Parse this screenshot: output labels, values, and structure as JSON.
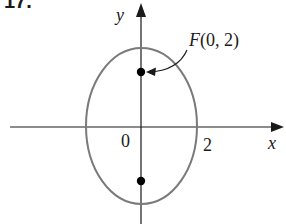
{
  "figure": {
    "problem_number": "17.",
    "axis_labels": {
      "x": "x",
      "y": "y"
    },
    "tick_labels": {
      "origin": "0",
      "x_tick": "2"
    },
    "annotation": {
      "label": "F(0, 2)",
      "label_italic_part": "F",
      "label_rest": "(0, 2)"
    },
    "colors": {
      "axes": "#1a1a1a",
      "ellipse": "#7a7a7a",
      "points": "#000000"
    }
  },
  "diagram": {
    "type": "ellipse-with-foci",
    "center": [
      0,
      0
    ],
    "semi_axis_x": 2,
    "foci": [
      [
        0,
        2
      ],
      [
        0,
        -2
      ]
    ],
    "labeled_focus": {
      "name": "F",
      "coords": [
        0,
        2
      ]
    },
    "x_intercept_marked": 2
  }
}
